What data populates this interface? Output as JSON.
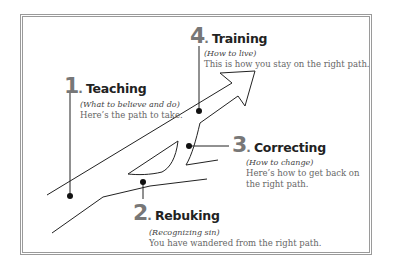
{
  "diagram": {
    "steps": [
      {
        "number": "1",
        "title": "Teaching",
        "subtitle": "(What to believe and do)",
        "body": [
          "Here’s the path to take."
        ]
      },
      {
        "number": "2",
        "title": "Rebuking",
        "subtitle": "(Recognizing sin)",
        "body": [
          "You have wandered from the right path."
        ]
      },
      {
        "number": "3",
        "title": "Correcting",
        "subtitle": "(How to change)",
        "body": [
          "Here’s how to get back on",
          "the right path."
        ]
      },
      {
        "number": "4",
        "title": "Training",
        "subtitle": "(How to live)",
        "body": [
          "This is how you stay on the right path."
        ]
      }
    ],
    "colors": {
      "frame": "#9a9a9a",
      "number": "#777777",
      "title": "#222222",
      "subtitle": "#444444",
      "body": "#666666",
      "line": "#222222"
    }
  }
}
